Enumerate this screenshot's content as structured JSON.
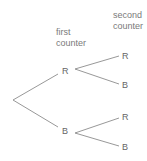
{
  "diagram": {
    "type": "probability-tree",
    "headers": {
      "first": [
        "first",
        "counter"
      ],
      "second": [
        "second",
        "counter"
      ]
    },
    "first_level": [
      {
        "label": "R",
        "children": [
          {
            "label": "R"
          },
          {
            "label": "B"
          }
        ]
      },
      {
        "label": "B",
        "children": [
          {
            "label": "R"
          },
          {
            "label": "B"
          }
        ]
      }
    ],
    "line_color": "#8c8c8c"
  }
}
